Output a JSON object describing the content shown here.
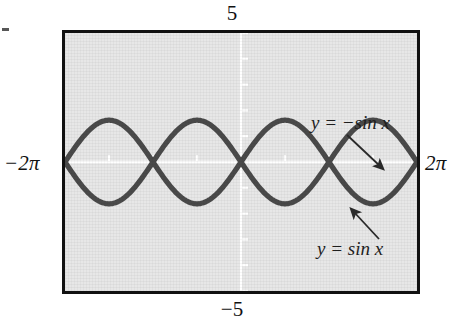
{
  "figure": {
    "kind": "graphing-calculator-screen",
    "window": {
      "ymax_label": "5",
      "ymin_label": "−5",
      "xmin_label": "−2π",
      "xmax_label": "2π"
    },
    "annotations": [
      {
        "name": "neg-sin",
        "text": "y = −sin x"
      },
      {
        "name": "pos-sin",
        "text": "y = sin x"
      }
    ],
    "colors": {
      "screen_background": "#e7e7e7",
      "screen_border": "#111111",
      "curve": "#4a4a4a",
      "axis": "#ffffff",
      "page_background": "#ffffff",
      "text": "#1a1a1a"
    }
  },
  "chart_data": {
    "type": "line",
    "title": "",
    "subtitle": "",
    "xlabel": "",
    "ylabel": "",
    "xlim": [
      -6.283185307179586,
      6.283185307179586
    ],
    "ylim": [
      -5,
      5
    ],
    "xlim_label": [
      "-2π",
      "2π"
    ],
    "ylim_label": [
      "-5",
      "5"
    ],
    "grid": false,
    "axes_shown": [
      "x-axis",
      "y-axis"
    ],
    "axis_color": "#ffffff",
    "x_tick_spacing": 1.5707963267948966,
    "y_tick_spacing": 1,
    "legend": "inline-annotations",
    "legend_position": "right-inside",
    "series": [
      {
        "name": "y = sin x",
        "expression": "sin(x)",
        "color": "#4a4a4a",
        "amplitude": 1,
        "period": 6.283185307179586,
        "key_points": [
          {
            "x": -6.2832,
            "y": 0
          },
          {
            "x": -4.7124,
            "y": -1
          },
          {
            "x": -3.1416,
            "y": 0
          },
          {
            "x": -1.5708,
            "y": -1
          },
          {
            "x": 0,
            "y": 0
          },
          {
            "x": 1.5708,
            "y": 1
          },
          {
            "x": 3.1416,
            "y": 0
          },
          {
            "x": 4.7124,
            "y": 1
          },
          {
            "x": 6.2832,
            "y": 0
          }
        ]
      },
      {
        "name": "y = -sin x",
        "expression": "-sin(x)",
        "color": "#4a4a4a",
        "amplitude": 1,
        "period": 6.283185307179586,
        "key_points": [
          {
            "x": -6.2832,
            "y": 0
          },
          {
            "x": -4.7124,
            "y": 1
          },
          {
            "x": -3.1416,
            "y": 0
          },
          {
            "x": -1.5708,
            "y": 1
          },
          {
            "x": 0,
            "y": 0
          },
          {
            "x": 1.5708,
            "y": -1
          },
          {
            "x": 3.1416,
            "y": 0
          },
          {
            "x": 4.7124,
            "y": -1
          },
          {
            "x": 6.2832,
            "y": 0
          }
        ]
      }
    ],
    "intersections_x": [
      -6.2832,
      -3.1416,
      0,
      3.1416,
      6.2832
    ],
    "annotations": [
      {
        "text": "y = -sin x",
        "points_to_series": "y = -sin x"
      },
      {
        "text": "y = sin x",
        "points_to_series": "y = sin x"
      }
    ]
  }
}
